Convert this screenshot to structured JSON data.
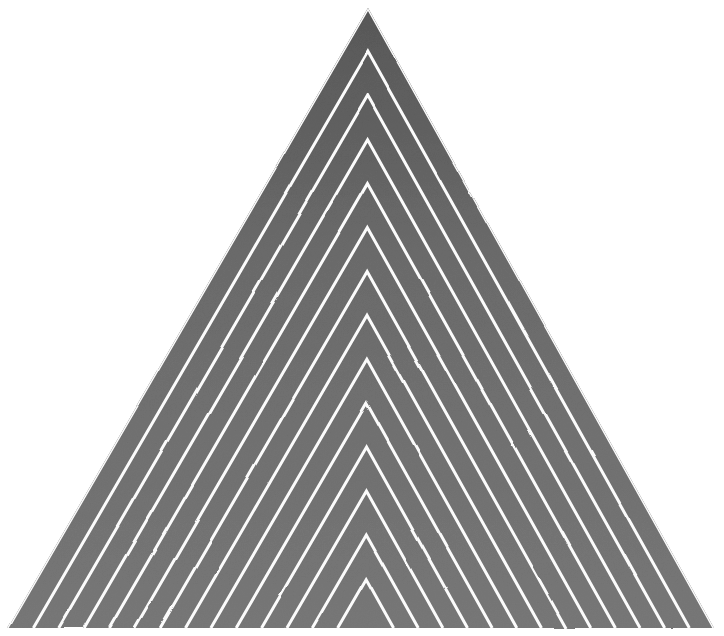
{
  "canvas": {
    "width": 724,
    "height": 636,
    "background_color": "#ffffff",
    "title": "Nested Chevron Triangle"
  },
  "artwork": {
    "name": "concentric-chevron-triangle",
    "medium_look": "graphite / charcoal drawing on white paper",
    "description": "A large isoceles triangle filled with a dark grey graphite tone, overlaid by a series of thin white lines running parallel to the two sloping sides, forming nested chevrons that converge toward the bottom centre.",
    "triangle": {
      "apex": {
        "x": 368,
        "y": 8
      },
      "base_left": {
        "x": 8,
        "y": 628
      },
      "base_right": {
        "x": 714,
        "y": 628
      }
    },
    "fill": {
      "type": "vertical-gradient",
      "stops": [
        {
          "offset": 0.0,
          "color": "#343434"
        },
        {
          "offset": 0.18,
          "color": "#444444"
        },
        {
          "offset": 0.4,
          "color": "#5c5c5c"
        },
        {
          "offset": 0.62,
          "color": "#666666"
        },
        {
          "offset": 0.82,
          "color": "#6e6e6e"
        },
        {
          "offset": 1.0,
          "color": "#767676"
        }
      ]
    },
    "lines": {
      "color": "#fbfbfb",
      "count_per_side": 14,
      "stroke_width": 3.0,
      "base_spacing_px": 25,
      "orientation": "parallel to the triangle's left and right edges",
      "convergence_point": {
        "x": 366,
        "y": 628
      }
    },
    "texture": {
      "grain_opacity": 0.22,
      "grain_seed": 7,
      "paper_tone": "#ffffff"
    }
  },
  "chevron_offsets": [
    0,
    25,
    50,
    75,
    100,
    125,
    150,
    175,
    200,
    225,
    250,
    275,
    300,
    325
  ]
}
